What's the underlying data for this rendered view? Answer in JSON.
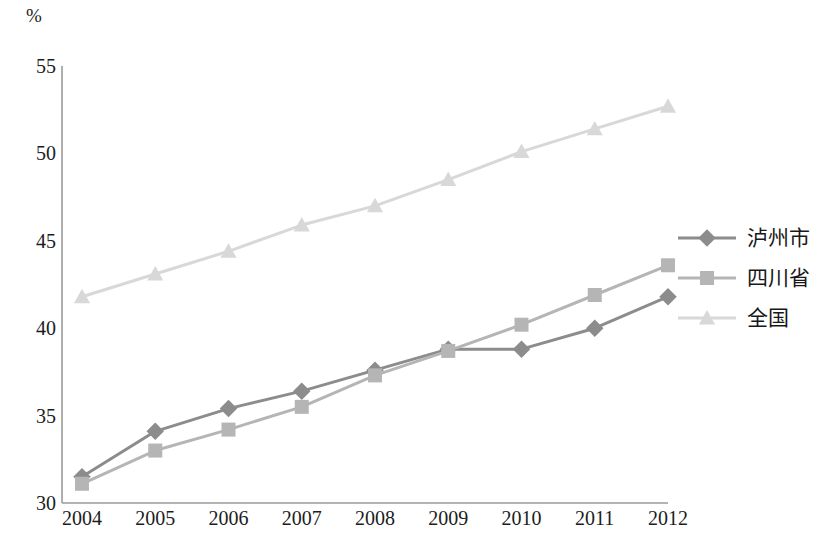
{
  "axis": {
    "unit_label": "%",
    "y_ticks": [
      "55",
      "50",
      "45",
      "40",
      "35",
      "30"
    ],
    "x_ticks": [
      "2004",
      "2005",
      "2006",
      "2007",
      "2008",
      "2009",
      "2010",
      "2011",
      "2012"
    ]
  },
  "legend": {
    "items": [
      {
        "label": "泸州市",
        "marker": "diamond-marker-icon",
        "color": "#8c8c8c"
      },
      {
        "label": "四川省",
        "marker": "square-marker-icon",
        "color": "#b5b5b5"
      },
      {
        "label": "全国",
        "marker": "triangle-marker-icon",
        "color": "#d8d8d8"
      }
    ]
  },
  "chart_data": {
    "type": "line",
    "title": "",
    "xlabel": "",
    "ylabel": "%",
    "categories": [
      "2004",
      "2005",
      "2006",
      "2007",
      "2008",
      "2009",
      "2010",
      "2011",
      "2012"
    ],
    "ylim": [
      30,
      55
    ],
    "ytick_step": 5,
    "grid": false,
    "legend_position": "right",
    "series": [
      {
        "name": "泸州市",
        "marker": "diamond",
        "color": "#8c8c8c",
        "values": [
          31.5,
          34.1,
          35.4,
          36.4,
          37.6,
          38.8,
          38.8,
          40.0,
          41.8
        ]
      },
      {
        "name": "四川省",
        "marker": "square",
        "color": "#b5b5b5",
        "values": [
          31.1,
          33.0,
          34.2,
          35.5,
          37.3,
          38.7,
          40.2,
          41.9,
          43.6
        ]
      },
      {
        "name": "全国",
        "marker": "triangle",
        "color": "#d8d8d8",
        "values": [
          41.8,
          43.1,
          44.4,
          45.9,
          47.0,
          48.5,
          50.1,
          51.4,
          52.7
        ]
      }
    ]
  }
}
